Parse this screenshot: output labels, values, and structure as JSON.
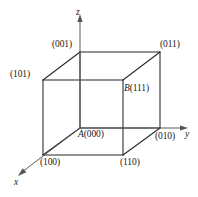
{
  "figure": {
    "kind": "cube-vertex-coordinate-diagram",
    "width": 198,
    "height": 197,
    "background_color": "#ffffff",
    "line_color": "#262626",
    "text_color": "#1a1a1a"
  },
  "axes": {
    "origin_label": "A",
    "x": {
      "label": "x",
      "arrow": true
    },
    "y": {
      "label": "y",
      "arrow": true
    },
    "z": {
      "label": "z",
      "arrow": true
    }
  },
  "vertices": {
    "v001": {
      "label": "(001)",
      "code": "001",
      "position": "top-back-left"
    },
    "v011": {
      "label": "(011)",
      "code": "011",
      "position": "top-back-right"
    },
    "v101": {
      "label": "(101)",
      "code": "101",
      "position": "top-front-left"
    },
    "v111": {
      "name": "B",
      "label": "(111)",
      "code": "111",
      "position": "top-front-right"
    },
    "v000": {
      "name": "A",
      "label": "(000)",
      "code": "000",
      "position": "bottom-back-left"
    },
    "v010": {
      "label": "(010)",
      "code": "010",
      "position": "bottom-back-right"
    },
    "v100": {
      "label": "(100)",
      "code": "100",
      "position": "bottom-front-left"
    },
    "v110": {
      "label": "(110)",
      "code": "110",
      "position": "bottom-front-right"
    }
  }
}
